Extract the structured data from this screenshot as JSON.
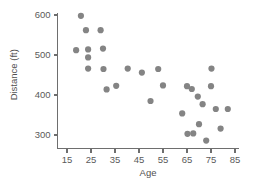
{
  "chart_data": {
    "type": "scatter",
    "title": "",
    "xlabel": "Age",
    "ylabel": "Distance (ft)",
    "xlim": [
      10,
      87
    ],
    "ylim": [
      270,
      615
    ],
    "xticks": [
      15,
      25,
      35,
      45,
      55,
      65,
      75,
      85
    ],
    "yticks": [
      300,
      400,
      500,
      600
    ],
    "xtick_labels": [
      "15",
      "25",
      "35",
      "45",
      "55",
      "65",
      "75",
      "85"
    ],
    "ytick_labels": [
      "300",
      "400",
      "500",
      "600"
    ],
    "grid": false,
    "legend": false,
    "marker_color": "#848484",
    "axis_color": "#6e6e6e",
    "points": [
      {
        "x": 20.8,
        "y": 598
      },
      {
        "x": 22.9,
        "y": 562
      },
      {
        "x": 29.0,
        "y": 562
      },
      {
        "x": 18.8,
        "y": 512
      },
      {
        "x": 23.8,
        "y": 514
      },
      {
        "x": 30.0,
        "y": 516
      },
      {
        "x": 23.8,
        "y": 494
      },
      {
        "x": 23.8,
        "y": 466
      },
      {
        "x": 30.2,
        "y": 465
      },
      {
        "x": 40.3,
        "y": 466
      },
      {
        "x": 46.2,
        "y": 456
      },
      {
        "x": 53.0,
        "y": 465
      },
      {
        "x": 31.5,
        "y": 414
      },
      {
        "x": 35.5,
        "y": 423
      },
      {
        "x": 55.0,
        "y": 424
      },
      {
        "x": 49.8,
        "y": 385
      },
      {
        "x": 75.2,
        "y": 466
      },
      {
        "x": 65.0,
        "y": 422
      },
      {
        "x": 67.0,
        "y": 415
      },
      {
        "x": 75.0,
        "y": 422
      },
      {
        "x": 69.5,
        "y": 396
      },
      {
        "x": 71.5,
        "y": 377
      },
      {
        "x": 77.0,
        "y": 365
      },
      {
        "x": 82.0,
        "y": 365
      },
      {
        "x": 63.0,
        "y": 354
      },
      {
        "x": 70.0,
        "y": 327
      },
      {
        "x": 79.0,
        "y": 316
      },
      {
        "x": 65.2,
        "y": 303
      },
      {
        "x": 67.6,
        "y": 304
      },
      {
        "x": 73.0,
        "y": 286
      }
    ]
  }
}
